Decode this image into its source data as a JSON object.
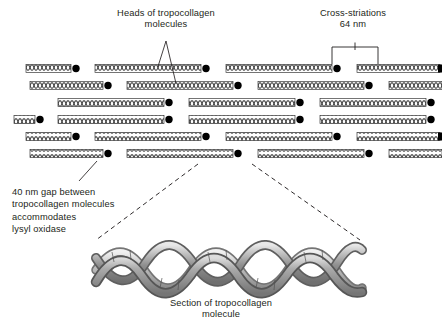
{
  "figure": {
    "title_absent": true,
    "background": "#ffffff",
    "ink": "#231f20",
    "rod_fill": "#ffffff",
    "rod_stroke": "#3a3a3a",
    "head_color": "#000000",
    "helix_color": "#9a9a9a"
  },
  "labels": {
    "heads": "Heads of tropocollagen\nmolecules",
    "cross_striations": "Cross-striations\n64 nm",
    "gap": "40 nm gap between\ntropocollagen molecules\naccommodates\nlysyl oxidase",
    "helix_caption": "Section of tropocollagen\nmolecule"
  },
  "measurements": {
    "cross_striation_period": "64 nm",
    "gap_length": "40 nm"
  },
  "diagram_data": {
    "type": "schematic",
    "subject": "collagen fibril quarter-stagger assembly",
    "row_count": 6,
    "rows": [
      {
        "index": 0,
        "y": 68,
        "offset": 26,
        "rods": [
          {
            "x": 26,
            "w": 52
          },
          {
            "x": 95,
            "w": 113
          },
          {
            "x": 226,
            "w": 113
          },
          {
            "x": 357,
            "w": 85
          }
        ]
      },
      {
        "index": 1,
        "y": 85,
        "offset": 30,
        "rods": [
          {
            "x": 30,
            "w": 80
          },
          {
            "x": 127,
            "w": 113
          },
          {
            "x": 258,
            "w": 113
          },
          {
            "x": 389,
            "w": 53
          }
        ]
      },
      {
        "index": 2,
        "y": 102,
        "offset": 0,
        "rods": [
          {
            "x": 58,
            "w": 113
          },
          {
            "x": 189,
            "w": 113
          },
          {
            "x": 320,
            "w": 113
          }
        ]
      },
      {
        "index": 3,
        "y": 119,
        "offset": 0,
        "rods": [
          {
            "x": 14,
            "w": 26
          },
          {
            "x": 58,
            "w": 113
          },
          {
            "x": 189,
            "w": 113
          },
          {
            "x": 320,
            "w": 113
          }
        ]
      },
      {
        "index": 4,
        "y": 136,
        "offset": 26,
        "rods": [
          {
            "x": 26,
            "w": 52
          },
          {
            "x": 95,
            "w": 113
          },
          {
            "x": 226,
            "w": 113
          },
          {
            "x": 357,
            "w": 85
          }
        ]
      },
      {
        "index": 5,
        "y": 153,
        "offset": 30,
        "rods": [
          {
            "x": 30,
            "w": 80
          },
          {
            "x": 127,
            "w": 113
          },
          {
            "x": 258,
            "w": 113
          },
          {
            "x": 389,
            "w": 53
          }
        ]
      }
    ],
    "head_marker": {
      "shape": "filled-circle",
      "radius": 3.6,
      "position": "right-end-of-rod"
    },
    "rod_texture": "braided cross-hatch (triple-helix shorthand)",
    "bracket": {
      "left_x": 332,
      "right_x": 378,
      "top_y": 47,
      "bottom_y": 64,
      "tick": "down-tick at center"
    },
    "leader_lines": [
      {
        "from": "heads-label",
        "to_row": 0,
        "x1": 166,
        "y1": 40,
        "x2": 160,
        "y2": 68
      },
      {
        "from": "heads-label",
        "to_row": 1,
        "x1": 166,
        "y1": 40,
        "x2": 178,
        "y2": 85
      },
      {
        "from": "gap-label",
        "to_gap": true,
        "x1": 78,
        "y1": 182,
        "x2": 96,
        "y2": 162
      }
    ],
    "zoom_connectors": [
      {
        "x1": 196,
        "y1": 166,
        "x2": 95,
        "y2": 240
      },
      {
        "x1": 252,
        "y1": 166,
        "x2": 360,
        "y2": 240
      }
    ],
    "helix": {
      "strands": 3,
      "x": 95,
      "y": 246,
      "width": 265,
      "height": 48,
      "style": "shaded 3D triple braid"
    }
  }
}
